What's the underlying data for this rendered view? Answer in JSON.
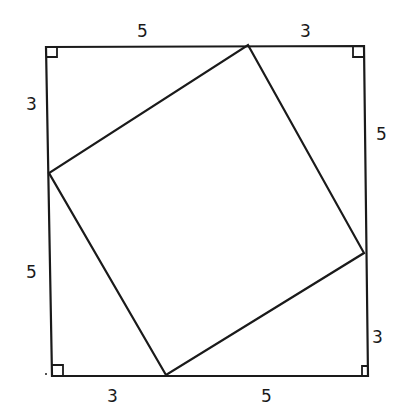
{
  "diagram": {
    "stroke_color": "#1a1a1a",
    "background": "#ffffff",
    "outer_square": {
      "top_left": [
        46,
        47
      ],
      "top_right": [
        364,
        46
      ],
      "bottom_right": [
        368,
        376
      ],
      "bottom_left": [
        52,
        376
      ]
    },
    "inner_square": {
      "top": [
        248,
        45
      ],
      "right": [
        364,
        253
      ],
      "bottom": [
        166,
        375
      ],
      "left": [
        49,
        173
      ]
    },
    "labels": {
      "top_left_segment": "5",
      "top_right_segment": "3",
      "left_top_segment": "3",
      "left_bottom_segment": "5",
      "right_top_segment": "5",
      "right_bottom_segment": "3",
      "bottom_left_segment": "3",
      "bottom_right_segment": "5"
    },
    "right_angle_markers": [
      "top-left",
      "top-right",
      "bottom-left",
      "bottom-right"
    ]
  }
}
